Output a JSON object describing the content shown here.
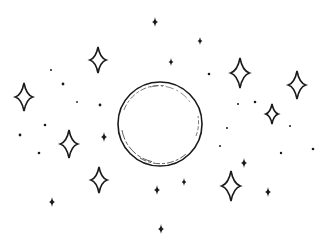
{
  "scene": {
    "description": "Line-art illustration of a moon surrounded by twinkling stars and dots",
    "width": 321,
    "height": 246,
    "background": "#ffffff",
    "ink": "#1a1a1a"
  },
  "moon": {
    "cx": 160,
    "cy": 124,
    "r": 42
  },
  "outline_stars": [
    {
      "x": 98,
      "y": 60,
      "s": 13
    },
    {
      "x": 24,
      "y": 97,
      "s": 14
    },
    {
      "x": 240,
      "y": 73,
      "s": 15
    },
    {
      "x": 297,
      "y": 85,
      "s": 14
    },
    {
      "x": 272,
      "y": 114,
      "s": 10
    },
    {
      "x": 69,
      "y": 144,
      "s": 14
    },
    {
      "x": 99,
      "y": 180,
      "s": 13
    },
    {
      "x": 231,
      "y": 186,
      "s": 15
    }
  ],
  "solid_stars": [
    {
      "x": 155,
      "y": 22,
      "s": 5
    },
    {
      "x": 200,
      "y": 41,
      "s": 4
    },
    {
      "x": 171,
      "y": 62,
      "s": 4
    },
    {
      "x": 104,
      "y": 137,
      "s": 5
    },
    {
      "x": 52,
      "y": 202,
      "s": 5
    },
    {
      "x": 244,
      "y": 163,
      "s": 5
    },
    {
      "x": 184,
      "y": 182,
      "s": 4
    },
    {
      "x": 268,
      "y": 192,
      "s": 5
    },
    {
      "x": 157,
      "y": 190,
      "s": 5
    },
    {
      "x": 161,
      "y": 229,
      "s": 5
    }
  ],
  "dots": [
    {
      "x": 51,
      "y": 70,
      "r": 1.0
    },
    {
      "x": 63,
      "y": 84,
      "r": 1.4
    },
    {
      "x": 77,
      "y": 102,
      "r": 0.9
    },
    {
      "x": 100,
      "y": 105,
      "r": 1.4
    },
    {
      "x": 20,
      "y": 135,
      "r": 1.4
    },
    {
      "x": 45,
      "y": 125,
      "r": 1.3
    },
    {
      "x": 39,
      "y": 153,
      "r": 1.3
    },
    {
      "x": 209,
      "y": 74,
      "r": 1.3
    },
    {
      "x": 255,
      "y": 102,
      "r": 1.3
    },
    {
      "x": 238,
      "y": 104,
      "r": 1.0
    },
    {
      "x": 220,
      "y": 146,
      "r": 1.0
    },
    {
      "x": 281,
      "y": 153,
      "r": 1.2
    },
    {
      "x": 313,
      "y": 149,
      "r": 1.3
    },
    {
      "x": 227,
      "y": 128,
      "r": 1.0
    },
    {
      "x": 290,
      "y": 126,
      "r": 1.0
    }
  ]
}
